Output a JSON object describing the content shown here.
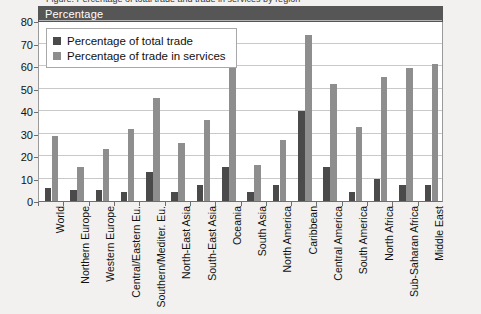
{
  "figure": {
    "title_fragment": "Figure. Percentage of total trade and trade in services by region",
    "band_label": "Percentage"
  },
  "legend": {
    "position": "top-left-inside",
    "items": [
      {
        "label": "Percentage of total trade",
        "color": "#4a4a4a",
        "swatch": "dark-square-icon"
      },
      {
        "label": "Percentage of trade in services",
        "color": "#8e8e8e",
        "swatch": "light-square-icon"
      }
    ]
  },
  "chart_data": {
    "type": "bar",
    "title": "Percentage",
    "xlabel": "",
    "ylabel": "Percentage",
    "ylim": [
      0,
      80
    ],
    "yticks": [
      0,
      10,
      20,
      30,
      40,
      50,
      60,
      70,
      80
    ],
    "grid": true,
    "categories": [
      "World",
      "Northern Europe",
      "Western Europe",
      "Central/Eastern Eu.",
      "Southern/Mediter. Eu.",
      "North-East Asia",
      "South-East Asia",
      "Oceania",
      "South Asia",
      "North America",
      "Caribbean",
      "Central America",
      "South America",
      "North Africa",
      "Sub-Saharan Africa",
      "Middle East"
    ],
    "series": [
      {
        "name": "Percentage of total trade",
        "color": "#4a4a4a",
        "values": [
          6,
          5,
          5,
          4,
          13,
          4,
          7,
          15,
          4,
          7,
          40,
          15,
          4,
          10,
          7,
          7
        ]
      },
      {
        "name": "Percentage of trade in services",
        "color": "#8e8e8e",
        "values": [
          29,
          15,
          23,
          32,
          46,
          26,
          36,
          73,
          16,
          27,
          74,
          52,
          33,
          55,
          59,
          61
        ]
      }
    ]
  }
}
